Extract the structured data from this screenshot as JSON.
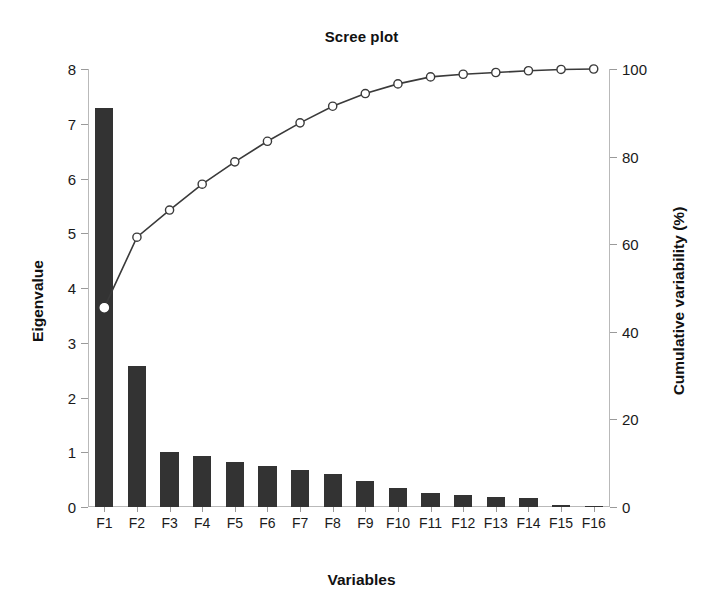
{
  "chart_data": {
    "type": "bar",
    "title": "Scree plot",
    "xlabel": "Variables",
    "ylabel": "Eigenvalue",
    "y2label": "Cumulative variability (%)",
    "categories": [
      "F1",
      "F2",
      "F3",
      "F4",
      "F5",
      "F6",
      "F7",
      "F8",
      "F9",
      "F10",
      "F11",
      "F12",
      "F13",
      "F14",
      "F15",
      "F16"
    ],
    "values": [
      7.29,
      2.57,
      1.0,
      0.94,
      0.82,
      0.75,
      0.68,
      0.6,
      0.47,
      0.35,
      0.26,
      0.22,
      0.19,
      0.16,
      0.03,
      0.01
    ],
    "ylim": [
      0,
      8
    ],
    "yticks": [
      0,
      1,
      2,
      3,
      4,
      5,
      6,
      7,
      8
    ],
    "y2lim": [
      0,
      100
    ],
    "y2ticks": [
      0,
      20,
      40,
      60,
      80,
      100
    ],
    "grid": false,
    "legend": "none",
    "series": [
      {
        "name": "Eigenvalue",
        "type": "bar",
        "axis": "left",
        "color": "#333333",
        "values": [
          7.29,
          2.57,
          1.0,
          0.94,
          0.82,
          0.75,
          0.68,
          0.6,
          0.47,
          0.35,
          0.26,
          0.22,
          0.19,
          0.16,
          0.03,
          0.01
        ]
      },
      {
        "name": "Cumulative variability (%)",
        "type": "line",
        "axis": "right",
        "color": "#3a3a3a",
        "marker": "open-circle",
        "values": [
          45.5,
          61.6,
          67.8,
          73.7,
          78.8,
          83.5,
          87.7,
          91.5,
          94.4,
          96.6,
          98.2,
          98.8,
          99.2,
          99.6,
          99.9,
          100.0
        ]
      }
    ]
  }
}
